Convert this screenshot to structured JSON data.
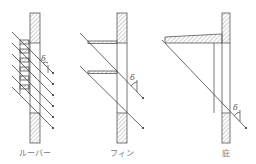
{
  "diagram": {
    "angle_symbol": "δ",
    "panels": [
      {
        "id": "louver",
        "label": "ルーバー",
        "slat_count": 6
      },
      {
        "id": "fin",
        "label": "フィン",
        "fin_count": 2
      },
      {
        "id": "eave",
        "label": "庇"
      }
    ],
    "colors": {
      "line": "#555555",
      "hatch": "#888888",
      "label": "#777777"
    }
  }
}
